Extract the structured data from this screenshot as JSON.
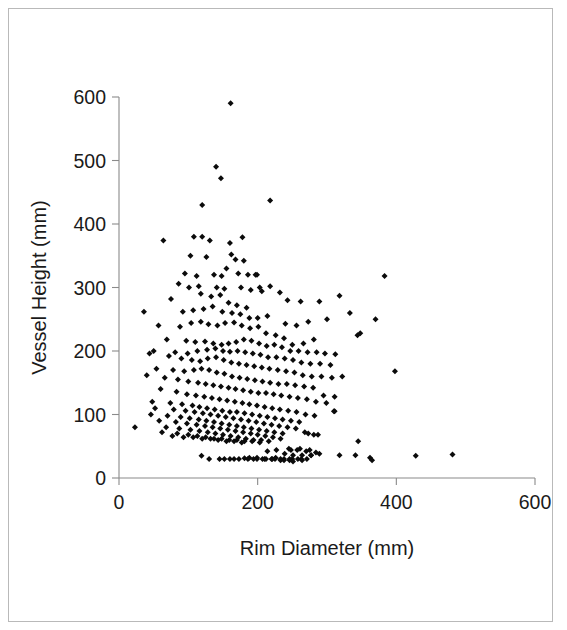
{
  "chart_data": {
    "type": "scatter",
    "title": "",
    "xlabel": "Rim Diameter (mm)",
    "ylabel": "Vessel Height (mm)",
    "xlim": [
      0,
      600
    ],
    "ylim": [
      0,
      600
    ],
    "xticks": [
      0,
      200,
      400,
      600
    ],
    "yticks": [
      0,
      100,
      200,
      300,
      400,
      500,
      600
    ],
    "xtick_labels": [
      "0",
      "200",
      "400",
      "600"
    ],
    "ytick_labels": [
      "0",
      "100",
      "200",
      "300",
      "400",
      "500",
      "600"
    ],
    "grid": false,
    "legend": null,
    "marker": {
      "shape": "diamond",
      "color": "#0b0b0b",
      "size": 4
    },
    "n_points": 402,
    "series": [
      {
        "name": "vessels",
        "x": [
          161,
          140,
          147,
          120,
          131,
          218,
          64,
          108,
          120,
          160,
          178,
          199,
          103,
          126,
          162,
          168,
          180,
          95,
          112,
          137,
          148,
          155,
          172,
          186,
          197,
          383,
          86,
          101,
          115,
          141,
          152,
          176,
          190,
          206,
          75,
          118,
          133,
          146,
          158,
          170,
          184,
          203,
          218,
          232,
          243,
          262,
          289,
          318,
          36,
          92,
          107,
          122,
          135,
          149,
          163,
          175,
          188,
          200,
          214,
          240,
          256,
          273,
          300,
          333,
          370,
          57,
          88,
          104,
          118,
          129,
          142,
          153,
          166,
          177,
          189,
          201,
          212,
          226,
          238,
          250,
          266,
          281,
          344,
          69,
          97,
          110,
          124,
          136,
          148,
          158,
          169,
          180,
          191,
          202,
          213,
          224,
          235,
          247,
          259,
          272,
          285,
          297,
          312,
          348,
          50,
          81,
          99,
          113,
          127,
          139,
          150,
          160,
          171,
          182,
          193,
          204,
          215,
          227,
          239,
          251,
          263,
          276,
          290,
          305,
          44,
          72,
          90,
          105,
          117,
          128,
          140,
          151,
          162,
          173,
          184,
          195,
          206,
          217,
          229,
          241,
          253,
          265,
          278,
          292,
          307,
          322,
          398,
          54,
          78,
          94,
          108,
          119,
          130,
          141,
          152,
          163,
          174,
          185,
          196,
          207,
          218,
          230,
          242,
          254,
          267,
          280,
          295,
          311,
          40,
          66,
          85,
          100,
          114,
          125,
          136,
          147,
          158,
          168,
          179,
          190,
          201,
          212,
          223,
          234,
          246,
          258,
          271,
          284,
          299,
          23,
          60,
          83,
          98,
          111,
          123,
          134,
          145,
          156,
          167,
          178,
          188,
          199,
          210,
          221,
          232,
          244,
          256,
          269,
          282,
          311,
          48,
          74,
          91,
          106,
          116,
          127,
          138,
          149,
          160,
          170,
          181,
          192,
          203,
          214,
          225,
          236,
          248,
          260,
          273,
          287,
          52,
          79,
          96,
          109,
          121,
          132,
          143,
          154,
          165,
          176,
          187,
          198,
          209,
          220,
          231,
          243,
          255,
          268,
          281,
          46,
          70,
          89,
          102,
          115,
          126,
          137,
          148,
          159,
          170,
          180,
          191,
          202,
          213,
          224,
          236,
          248,
          261,
          275,
          289,
          58,
          82,
          98,
          112,
          124,
          135,
          146,
          157,
          168,
          179,
          190,
          200,
          211,
          222,
          233,
          245,
          257,
          270,
          284,
          68,
          87,
          103,
          116,
          128,
          139,
          150,
          161,
          172,
          183,
          194,
          205,
          216,
          227,
          239,
          251,
          264,
          277,
          62,
          84,
          100,
          113,
          125,
          137,
          148,
          159,
          170,
          181,
          192,
          203,
          214,
          226,
          238,
          250,
          263,
          77,
          93,
          107,
          120,
          132,
          143,
          155,
          166,
          177,
          188,
          199,
          210,
          221,
          233,
          246,
          119,
          152,
          166,
          181,
          194,
          207,
          220,
          233,
          246,
          258,
          271,
          130,
          145,
          160,
          173,
          186,
          199,
          212,
          225,
          238,
          251,
          264,
          277,
          318,
          341,
          362,
          365,
          428,
          481,
          345,
          310
        ]
      }
    ],
    "series_y": [
      590,
      490,
      472,
      430,
      374,
      437,
      374,
      380,
      380,
      370,
      379,
      320,
      350,
      348,
      352,
      344,
      342,
      322,
      318,
      320,
      318,
      330,
      322,
      320,
      320,
      318,
      306,
      300,
      302,
      300,
      298,
      300,
      296,
      294,
      282,
      290,
      286,
      288,
      276,
      272,
      268,
      300,
      302,
      292,
      280,
      278,
      278,
      287,
      262,
      262,
      264,
      266,
      270,
      262,
      260,
      258,
      252,
      252,
      255,
      243,
      240,
      246,
      250,
      260,
      250,
      240,
      238,
      244,
      246,
      242,
      240,
      244,
      245,
      240,
      236,
      238,
      228,
      225,
      220,
      210,
      212,
      218,
      225,
      218,
      216,
      214,
      215,
      212,
      210,
      212,
      214,
      218,
      216,
      212,
      208,
      210,
      206,
      200,
      200,
      198,
      198,
      196,
      195,
      228,
      200,
      198,
      196,
      200,
      202,
      204,
      200,
      199,
      200,
      198,
      196,
      194,
      190,
      190,
      188,
      186,
      182,
      180,
      180,
      178,
      196,
      192,
      188,
      186,
      184,
      188,
      190,
      186,
      182,
      180,
      178,
      176,
      174,
      172,
      170,
      168,
      166,
      162,
      160,
      160,
      158,
      160,
      168,
      172,
      170,
      168,
      170,
      172,
      170,
      166,
      164,
      160,
      158,
      156,
      154,
      152,
      150,
      148,
      148,
      146,
      144,
      142,
      130,
      128,
      162,
      158,
      155,
      152,
      150,
      148,
      146,
      144,
      142,
      140,
      138,
      136,
      134,
      134,
      132,
      130,
      128,
      126,
      124,
      120,
      118,
      80,
      140,
      136,
      132,
      130,
      128,
      126,
      124,
      122,
      120,
      118,
      116,
      114,
      112,
      110,
      108,
      106,
      104,
      100,
      98,
      105,
      120,
      118,
      116,
      114,
      112,
      110,
      108,
      106,
      104,
      104,
      102,
      100,
      98,
      96,
      94,
      92,
      90,
      88,
      70,
      68,
      110,
      108,
      106,
      104,
      102,
      100,
      98,
      96,
      94,
      92,
      90,
      88,
      86,
      84,
      82,
      80,
      78,
      72,
      68,
      100,
      98,
      96,
      94,
      92,
      90,
      88,
      86,
      84,
      82,
      80,
      78,
      76,
      74,
      72,
      70,
      44,
      46,
      44,
      38,
      90,
      88,
      86,
      84,
      82,
      80,
      78,
      76,
      74,
      72,
      70,
      68,
      66,
      64,
      62,
      46,
      44,
      42,
      40,
      80,
      78,
      76,
      74,
      72,
      70,
      68,
      66,
      64,
      62,
      60,
      60,
      58,
      44,
      38,
      36,
      36,
      36,
      72,
      70,
      68,
      66,
      64,
      62,
      62,
      60,
      60,
      58,
      58,
      56,
      42,
      32,
      30,
      30,
      30,
      66,
      64,
      64,
      62,
      62,
      60,
      58,
      58,
      56,
      32,
      32,
      30,
      30,
      30,
      30,
      35,
      30,
      30,
      31,
      30,
      30,
      30,
      28,
      28,
      30,
      30,
      30,
      30,
      30,
      30,
      30,
      30,
      30,
      30,
      28,
      26,
      28,
      36,
      36,
      36,
      32,
      28,
      35,
      37,
      58,
      105
    ]
  }
}
